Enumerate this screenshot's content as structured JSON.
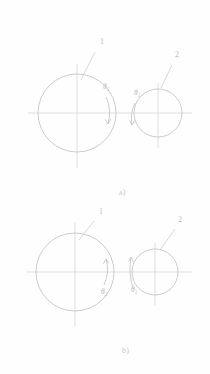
{
  "figure": {
    "background_color": "#fefefe",
    "line_color": "#c3c3c3",
    "text_color": "#c8c8c8",
    "label_color": "#bdbdbd"
  },
  "panels": [
    {
      "id": "panel-a",
      "caption": "a)",
      "caption_x": 119,
      "caption_y": 188,
      "rotation_sense": "clockwise",
      "circles": [
        {
          "name": "large-circle",
          "leader_label": "1",
          "label_x": 100,
          "label_y": 44,
          "cx": 77,
          "cy": 113,
          "r": 39,
          "axis_x_from": 28,
          "axis_x_to": 126,
          "axis_y_from": 64,
          "axis_y_to": 168,
          "leader_from_x": 95,
          "leader_from_y": 52,
          "leader_to_x": 81,
          "leader_to_y": 80
        },
        {
          "name": "small-circle",
          "leader_label": "2",
          "label_x": 175,
          "label_y": 57,
          "cx": 158,
          "cy": 113,
          "r": 24,
          "axis_x_from": 126,
          "axis_x_to": 192,
          "axis_y_from": 83,
          "axis_y_to": 148,
          "leader_from_x": 172,
          "leader_from_y": 65,
          "leader_to_x": 161,
          "leader_to_y": 88
        }
      ],
      "angle_arcs": [
        {
          "name": "theta2-arc",
          "label": "θ",
          "subscript": "2",
          "label_x": 103,
          "label_y": 89,
          "arrow_direction": "down"
        },
        {
          "name": "theta1-arc",
          "label": "θ",
          "subscript": "1",
          "label_x": 134,
          "label_y": 95,
          "arrow_direction": "down"
        }
      ]
    },
    {
      "id": "panel-b",
      "caption": "b)",
      "caption_x": 122,
      "caption_y": 346,
      "rotation_sense": "counter-clockwise",
      "circles": [
        {
          "name": "large-circle",
          "leader_label": "1",
          "label_x": 99,
          "label_y": 214,
          "cx": 75,
          "cy": 272,
          "r": 39,
          "axis_x_from": 26,
          "axis_x_to": 124,
          "axis_y_from": 223,
          "axis_y_to": 327,
          "leader_from_x": 94,
          "leader_from_y": 221,
          "leader_to_x": 79,
          "leader_to_y": 240
        },
        {
          "name": "small-circle",
          "leader_label": "2",
          "label_x": 178,
          "label_y": 222,
          "cx": 155,
          "cy": 272,
          "r": 23,
          "axis_x_from": 124,
          "axis_x_to": 192,
          "axis_y_from": 243,
          "axis_y_to": 305,
          "leader_from_x": 175,
          "leader_from_y": 229,
          "leader_to_x": 160,
          "leader_to_y": 250
        }
      ],
      "angle_arcs": [
        {
          "name": "theta2-arc",
          "label": "θ",
          "subscript": "2",
          "label_x": 101,
          "label_y": 286,
          "arrow_direction": "up"
        },
        {
          "name": "theta1-arc",
          "label": "θ",
          "subscript": "1",
          "label_x": 131,
          "label_y": 284,
          "arrow_direction": "up"
        }
      ]
    }
  ]
}
